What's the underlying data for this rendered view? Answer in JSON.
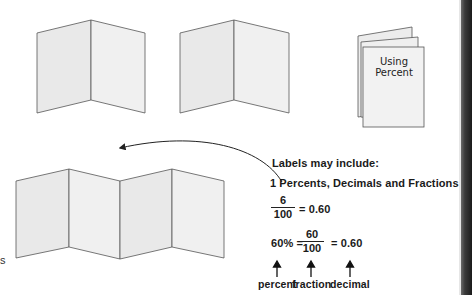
{
  "booklet": {
    "title_line1": "Using",
    "title_line2": "Percent"
  },
  "labels": {
    "heading": "Labels may include:",
    "item1": "1 Percents, Decimals and Fractions"
  },
  "equation1": {
    "numerator": "6",
    "denominator": "100",
    "result": "= 0.60"
  },
  "equation2": {
    "percent": "60% =",
    "numerator": "60",
    "denominator": "100",
    "result": "= 0.60"
  },
  "arrow_labels": {
    "percent": "percent",
    "fraction": "fraction",
    "decimal": "decimal"
  },
  "edge_text": "s",
  "colors": {
    "panel_fill": "#ececec",
    "panel_stroke": "#555555",
    "spine": "#2a2a2a"
  }
}
